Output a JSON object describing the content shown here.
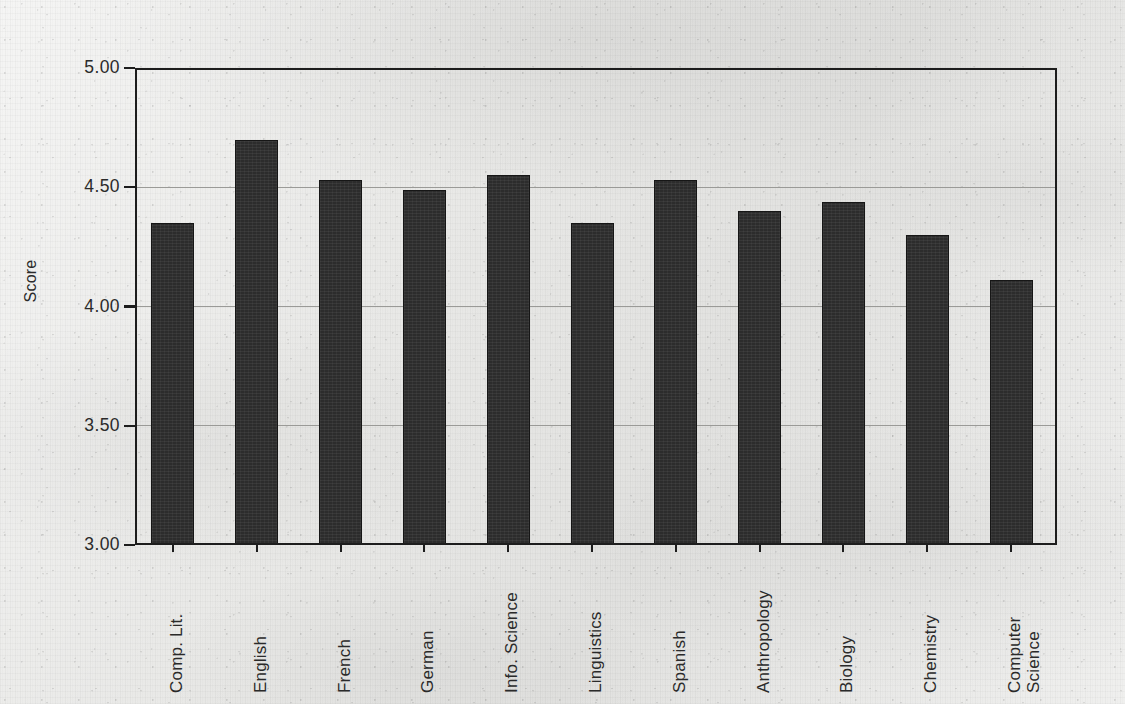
{
  "chart_data": {
    "type": "bar",
    "title": "",
    "subtitle": "",
    "xlabel": "",
    "ylabel": "Score",
    "ylim": [
      3.0,
      5.0
    ],
    "ytick_labels": [
      "5.00",
      "4.50",
      "4.00",
      "3.50",
      "3.00"
    ],
    "ytick_values": [
      5.0,
      4.5,
      4.0,
      3.5,
      3.0
    ],
    "gridlines": [
      "4.50",
      "4.00",
      "3.50"
    ],
    "grid": true,
    "legend": "none",
    "bar_color": "#2c2c2c",
    "categories": [
      "Comp. Lit.",
      "English",
      "French",
      "German",
      "Info. Science",
      "Linguistics",
      "Spanish",
      "Anthropology",
      "Biology",
      "Chemistry",
      "Computer\nScience"
    ],
    "values": [
      4.35,
      4.7,
      4.53,
      4.49,
      4.55,
      4.35,
      4.53,
      4.4,
      4.44,
      4.3,
      4.11
    ]
  },
  "colors": {
    "paper": "#e9e9e7",
    "ink": "#1d1d1d",
    "grid": "#9a9a97",
    "bar": "#2c2c2c",
    "text": "#2a2a2a"
  }
}
